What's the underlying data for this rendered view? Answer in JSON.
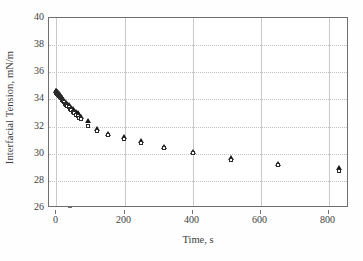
{
  "figure": {
    "background": "#ffffff",
    "frame_color": "#6f6f6f",
    "grid_color": "#c6c6c6"
  },
  "axis": {
    "xlabel": "Time, s",
    "ylabel": "Interfacial Tension, mN/m",
    "xticks": [
      "0",
      "200",
      "400",
      "600",
      "800"
    ],
    "yticks": [
      "26",
      "28",
      "30",
      "32",
      "34",
      "36",
      "38",
      "40"
    ]
  },
  "chart_data": {
    "type": "scatter",
    "title": "",
    "xlabel": "Time, s",
    "ylabel": "Interfacial Tension, mN/m",
    "xlim": [
      -22,
      860
    ],
    "ylim": [
      26,
      40
    ],
    "xticks": [
      0,
      200,
      400,
      600,
      800
    ],
    "yticks": [
      26,
      28,
      30,
      32,
      34,
      36,
      38,
      40
    ],
    "grid": true,
    "legend": "none",
    "series": [
      {
        "name": "series-filled-triangle",
        "marker": "filled-triangle",
        "color": "#161616",
        "points": [
          [
            1,
            34.55
          ],
          [
            2,
            34.52
          ],
          [
            3,
            34.5
          ],
          [
            4,
            34.48
          ],
          [
            5,
            34.45
          ],
          [
            6,
            34.42
          ],
          [
            7,
            34.4
          ],
          [
            8,
            34.36
          ],
          [
            9,
            34.33
          ],
          [
            10,
            34.3
          ],
          [
            12,
            34.24
          ],
          [
            14,
            34.18
          ],
          [
            16,
            34.12
          ],
          [
            18,
            34.06
          ],
          [
            20,
            34.0
          ],
          [
            23,
            33.92
          ],
          [
            26,
            33.84
          ],
          [
            29,
            33.76
          ],
          [
            32,
            33.68
          ],
          [
            35,
            33.6
          ],
          [
            39,
            33.5
          ],
          [
            43,
            33.4
          ],
          [
            47,
            33.3
          ],
          [
            51,
            33.2
          ],
          [
            55,
            33.1
          ],
          [
            60,
            33.0
          ],
          [
            65,
            32.9
          ],
          [
            70,
            32.8
          ],
          [
            75,
            32.65
          ],
          [
            97,
            32.35
          ],
          [
            122,
            31.75
          ],
          [
            155,
            31.4
          ],
          [
            200,
            31.15
          ],
          [
            252,
            30.85
          ],
          [
            320,
            30.45
          ],
          [
            405,
            30.05
          ],
          [
            515,
            29.6
          ],
          [
            655,
            29.2
          ],
          [
            835,
            28.9
          ]
        ]
      },
      {
        "name": "series-open-square",
        "marker": "open-square",
        "color": "#2b2b2b",
        "points": [
          [
            1,
            34.45
          ],
          [
            2,
            34.42
          ],
          [
            3,
            34.4
          ],
          [
            4,
            34.37
          ],
          [
            5,
            34.34
          ],
          [
            6,
            34.31
          ],
          [
            7,
            34.28
          ],
          [
            8,
            34.25
          ],
          [
            9,
            34.22
          ],
          [
            10,
            34.19
          ],
          [
            12,
            34.13
          ],
          [
            14,
            34.07
          ],
          [
            16,
            34.01
          ],
          [
            18,
            33.95
          ],
          [
            20,
            33.89
          ],
          [
            23,
            33.8
          ],
          [
            26,
            33.71
          ],
          [
            29,
            33.62
          ],
          [
            32,
            33.54
          ],
          [
            35,
            33.45
          ],
          [
            39,
            33.34
          ],
          [
            43,
            33.23
          ],
          [
            47,
            33.12
          ],
          [
            51,
            33.02
          ],
          [
            55,
            32.92
          ],
          [
            60,
            32.8
          ],
          [
            65,
            32.7
          ],
          [
            70,
            32.58
          ],
          [
            75,
            32.45
          ],
          [
            97,
            32.0
          ],
          [
            122,
            31.62
          ],
          [
            155,
            31.28
          ],
          [
            200,
            31.02
          ],
          [
            252,
            30.75
          ],
          [
            320,
            30.35
          ],
          [
            405,
            29.95
          ],
          [
            515,
            29.48
          ],
          [
            655,
            29.1
          ],
          [
            835,
            28.62
          ]
        ]
      }
    ]
  }
}
